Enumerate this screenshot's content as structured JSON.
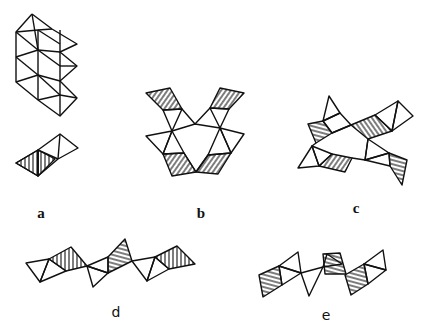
{
  "figure": {
    "panels": [
      {
        "id": "a",
        "label": "a",
        "description": "chain of edge-sharing octahedra (top) and pair of shared tetrahedra (bottom)"
      },
      {
        "id": "b",
        "label": "b",
        "description": "ring of six tetrahedra with hatched terminal units"
      },
      {
        "id": "c",
        "label": "c",
        "description": "ring of tetrahedra with branching hatched units"
      },
      {
        "id": "d",
        "label": "d",
        "description": "zig-zag chain of corner-sharing tetrahedra"
      },
      {
        "id": "e",
        "label": "e",
        "description": "zig-zag chain of corner-sharing tetrahedra, alternate orientation"
      }
    ]
  },
  "colors": {
    "line": "#111111",
    "background": "#ffffff"
  }
}
